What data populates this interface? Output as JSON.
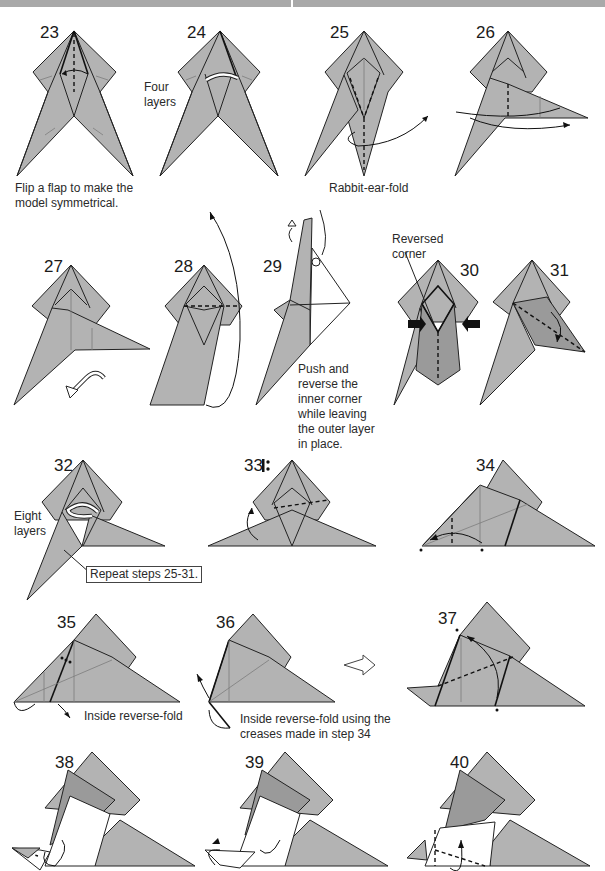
{
  "header": {
    "bar_color": "#a9a9a9"
  },
  "colors": {
    "paper_gray": "#b3b3b3",
    "paper_dark": "#9a9a9a",
    "line": "#222222",
    "background": "#ffffff"
  },
  "steps": [
    {
      "number": "23",
      "caption": "Flip a flap to make the model symmetrical.",
      "caption_lines": [
        "Flip a flap to make the",
        "model symmetrical."
      ]
    },
    {
      "number": "24",
      "label": "Four layers",
      "label_lines": [
        "Four",
        "layers"
      ]
    },
    {
      "number": "25",
      "caption": "Rabbit-ear-fold"
    },
    {
      "number": "26"
    },
    {
      "number": "27"
    },
    {
      "number": "28"
    },
    {
      "number": "29",
      "caption": "Push and reverse the inner corner while leaving the outer layer in place.",
      "caption_lines": [
        "Push and",
        "reverse the",
        "inner corner",
        "while leaving",
        "the outer layer",
        "in place."
      ]
    },
    {
      "number": "30",
      "label": "Reversed corner",
      "label_lines": [
        "Reversed",
        "corner"
      ]
    },
    {
      "number": "31"
    },
    {
      "number": "32",
      "label": "Eight layers",
      "label_lines": [
        "Eight",
        "layers"
      ],
      "callout": "Repeat steps 25-31."
    },
    {
      "number": "33",
      "symbol": "repeat-behind-icon"
    },
    {
      "number": "34"
    },
    {
      "number": "35",
      "caption": "Inside reverse-fold"
    },
    {
      "number": "36",
      "caption": "Inside reverse-fold using the creases made in step 34",
      "caption_lines": [
        "Inside reverse-fold using the",
        "creases made in step 34"
      ]
    },
    {
      "number": "37"
    },
    {
      "number": "38"
    },
    {
      "number": "39"
    },
    {
      "number": "40"
    }
  ]
}
